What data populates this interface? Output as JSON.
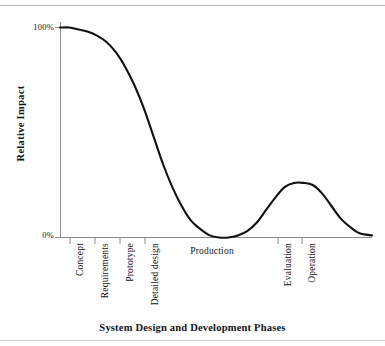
{
  "figure": {
    "background_color": "#fefefe",
    "rule_color": "#b9b9b9"
  },
  "chart_data": {
    "type": "line",
    "title": "",
    "subtitle": "",
    "xlabel": "System Design and Development Phases",
    "ylabel": "Relative Impact",
    "ylim": [
      0,
      100
    ],
    "ytick_labels": [
      "100%",
      "0%"
    ],
    "ytick_values": [
      100,
      0
    ],
    "grid": false,
    "legend": null,
    "legend_position": "none",
    "line_color": "#111111",
    "axis_color": "#8c8c8c",
    "categories": [
      "Concept",
      "Requirements",
      "Prototype",
      "Detailed design",
      "Production",
      "Evaluation",
      "Operation"
    ],
    "category_tick_x": [
      70,
      95,
      120,
      145,
      212,
      278,
      302
    ],
    "category_label_orientation": [
      "vertical",
      "vertical",
      "vertical",
      "vertical",
      "horizontal",
      "vertical",
      "vertical"
    ],
    "series": [
      {
        "name": "Relative Impact",
        "x": [
          0,
          3,
          6,
          9,
          12,
          15,
          18,
          21,
          24,
          27,
          30,
          33,
          36,
          39,
          42,
          45,
          48,
          51,
          54,
          57,
          60,
          63,
          66,
          69,
          72,
          75,
          78,
          81,
          84,
          87,
          90,
          93,
          96,
          100
        ],
        "values": [
          100,
          100,
          99,
          98,
          96,
          93,
          88,
          81,
          72,
          61,
          48,
          35,
          24,
          15,
          8,
          4,
          1,
          0,
          0,
          1,
          3,
          7,
          13,
          19,
          24,
          26,
          26,
          25,
          21,
          15,
          9,
          5,
          2,
          1
        ]
      }
    ],
    "annotations": []
  },
  "axis_titles": {
    "y": "Relative Impact",
    "x": "System Design and Development Phases"
  }
}
